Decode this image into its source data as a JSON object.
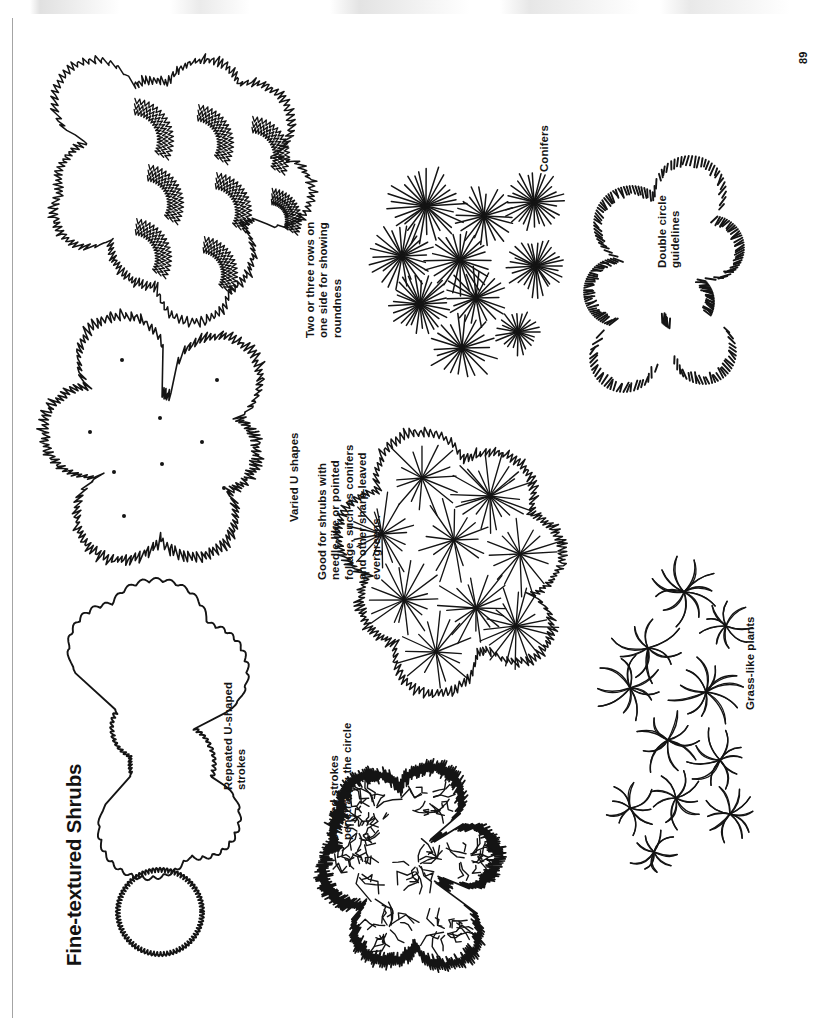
{
  "page": {
    "folio": "89",
    "title": "Fine-textured Shrubs",
    "orientation": "rotated-90-ccw",
    "background_color": "#ffffff",
    "ink_color": "#141414"
  },
  "captions": {
    "repeated_u_shaped_strokes": "Repeated U-shaped\nstrokes",
    "varied_u_shapes": "Varied U shapes",
    "two_or_three_rows": "Two or three rows on\none side for showing\nroundness",
    "jagged_strokes": "Jagged strokes\npenetrating the circle",
    "good_for_shrubs": "Good for shrubs with\nneedle-like or pointed\nfoliage, such as conifers\nand other sharp-leaved\nevergreens.",
    "conifers": "Conifers",
    "double_circle_guidelines": "Double circle\nguidelines",
    "grass_like_plants": "Grass-like plants"
  },
  "figures": [
    {
      "id": "fig-repeated-u",
      "name": "repeated-u-shaped-strokes-figure",
      "description": "Large amoeba-shaped shrub mass plus one small circle, outlined with repeated small U-shaped scallop strokes",
      "style": "scalloped-outline"
    },
    {
      "id": "fig-varied-u",
      "name": "varied-u-shapes-figure",
      "description": "Cluster of seven round shrub symbols with varied U-shaped edge strokes and a center dot in each",
      "style": "varied-u-outline-with-center-dots",
      "center_dots": 9
    },
    {
      "id": "fig-two-or-three-rows",
      "name": "two-or-three-rows-figure",
      "description": "Cluster of overlapping round shrub masses with two or three rows of fine zigzag strokes on one side to show roundness",
      "style": "shaded-one-side"
    },
    {
      "id": "fig-jagged",
      "name": "jagged-strokes-figure",
      "description": "Cluster of round shrub masses drawn with jagged strokes that penetrate the circle outline",
      "style": "jagged-penetrating"
    },
    {
      "id": "fig-conifers-large",
      "name": "needle-foliage-figure",
      "description": "Large shrub mass combining jagged outline with radiating needle strokes, good for needle-like or pointed foliage",
      "style": "radiating-needles-on-mass"
    },
    {
      "id": "fig-conifers",
      "name": "conifers-figure",
      "description": "Ten starburst symbols of radiating straight lines representing conifers in plan",
      "style": "starburst",
      "symbol_count": 10
    },
    {
      "id": "fig-double-circle",
      "name": "double-circle-guidelines-figure",
      "description": "Lobed shrub mass outlined with short radial hatch strokes drawn between double circle guidelines",
      "style": "radial-hatch-between-double-circles"
    },
    {
      "id": "fig-grass",
      "name": "grass-like-plants-figure",
      "description": "Eleven star-shaped clusters of curved blades representing grass-like plants",
      "style": "curved-blade-rosette",
      "symbol_count": 11
    }
  ]
}
